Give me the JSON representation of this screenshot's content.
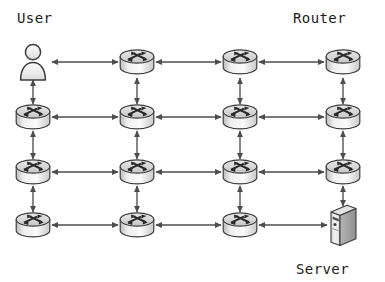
{
  "diagram": {
    "type": "network-topology",
    "background_color": "#ffffff",
    "line_color": "#4d4d4d",
    "icon_outline_color": "#3c3c3c",
    "icon_fill_light": "#f2f2f2",
    "icon_fill_mid": "#d8d8d8",
    "icon_fill_dark": "#a8a8a8",
    "label_color": "#1a1a1a",
    "labels": {
      "user": "User",
      "router": "Router",
      "server": "Server"
    },
    "grid": {
      "rows": 4,
      "columns": 4,
      "column_x": [
        33,
        137,
        240,
        343
      ],
      "row_y": [
        62,
        117,
        172,
        225
      ]
    },
    "nodes": [
      {
        "id": "n-r1c1",
        "kind": "user",
        "icon": "user-icon",
        "row": 1,
        "col": 1,
        "x": 33,
        "y": 62
      },
      {
        "id": "n-r1c2",
        "kind": "router",
        "icon": "router-icon",
        "row": 1,
        "col": 2,
        "x": 137,
        "y": 62
      },
      {
        "id": "n-r1c3",
        "kind": "router",
        "icon": "router-icon",
        "row": 1,
        "col": 3,
        "x": 240,
        "y": 62
      },
      {
        "id": "n-r1c4",
        "kind": "router",
        "icon": "router-icon",
        "row": 1,
        "col": 4,
        "x": 343,
        "y": 62
      },
      {
        "id": "n-r2c1",
        "kind": "router",
        "icon": "router-icon",
        "row": 2,
        "col": 1,
        "x": 33,
        "y": 117
      },
      {
        "id": "n-r2c2",
        "kind": "router",
        "icon": "router-icon",
        "row": 2,
        "col": 2,
        "x": 137,
        "y": 117
      },
      {
        "id": "n-r2c3",
        "kind": "router",
        "icon": "router-icon",
        "row": 2,
        "col": 3,
        "x": 240,
        "y": 117
      },
      {
        "id": "n-r2c4",
        "kind": "router",
        "icon": "router-icon",
        "row": 2,
        "col": 4,
        "x": 343,
        "y": 117
      },
      {
        "id": "n-r3c1",
        "kind": "router",
        "icon": "router-icon",
        "row": 3,
        "col": 1,
        "x": 33,
        "y": 172
      },
      {
        "id": "n-r3c2",
        "kind": "router",
        "icon": "router-icon",
        "row": 3,
        "col": 2,
        "x": 137,
        "y": 172
      },
      {
        "id": "n-r3c3",
        "kind": "router",
        "icon": "router-icon",
        "row": 3,
        "col": 3,
        "x": 240,
        "y": 172
      },
      {
        "id": "n-r3c4",
        "kind": "router",
        "icon": "router-icon",
        "row": 3,
        "col": 4,
        "x": 343,
        "y": 172
      },
      {
        "id": "n-r4c1",
        "kind": "router",
        "icon": "router-icon",
        "row": 4,
        "col": 1,
        "x": 33,
        "y": 225
      },
      {
        "id": "n-r4c2",
        "kind": "router",
        "icon": "router-icon",
        "row": 4,
        "col": 2,
        "x": 137,
        "y": 225
      },
      {
        "id": "n-r4c3",
        "kind": "router",
        "icon": "router-icon",
        "row": 4,
        "col": 3,
        "x": 240,
        "y": 225
      },
      {
        "id": "n-r4c4",
        "kind": "server",
        "icon": "server-icon",
        "row": 4,
        "col": 4,
        "x": 343,
        "y": 225
      }
    ],
    "links": [
      {
        "from": "n-r1c1",
        "to": "n-r1c2",
        "orientation": "horizontal",
        "arrows": "both"
      },
      {
        "from": "n-r1c2",
        "to": "n-r1c3",
        "orientation": "horizontal",
        "arrows": "both"
      },
      {
        "from": "n-r1c3",
        "to": "n-r1c4",
        "orientation": "horizontal",
        "arrows": "both"
      },
      {
        "from": "n-r2c1",
        "to": "n-r2c2",
        "orientation": "horizontal",
        "arrows": "both"
      },
      {
        "from": "n-r2c2",
        "to": "n-r2c3",
        "orientation": "horizontal",
        "arrows": "both"
      },
      {
        "from": "n-r2c3",
        "to": "n-r2c4",
        "orientation": "horizontal",
        "arrows": "both"
      },
      {
        "from": "n-r3c1",
        "to": "n-r3c2",
        "orientation": "horizontal",
        "arrows": "both"
      },
      {
        "from": "n-r3c2",
        "to": "n-r3c3",
        "orientation": "horizontal",
        "arrows": "both"
      },
      {
        "from": "n-r3c3",
        "to": "n-r3c4",
        "orientation": "horizontal",
        "arrows": "both"
      },
      {
        "from": "n-r4c1",
        "to": "n-r4c2",
        "orientation": "horizontal",
        "arrows": "both"
      },
      {
        "from": "n-r4c2",
        "to": "n-r4c3",
        "orientation": "horizontal",
        "arrows": "both"
      },
      {
        "from": "n-r4c3",
        "to": "n-r4c4",
        "orientation": "horizontal",
        "arrows": "both"
      },
      {
        "from": "n-r1c1",
        "to": "n-r2c1",
        "orientation": "vertical",
        "arrows": "both"
      },
      {
        "from": "n-r2c1",
        "to": "n-r3c1",
        "orientation": "vertical",
        "arrows": "both"
      },
      {
        "from": "n-r3c1",
        "to": "n-r4c1",
        "orientation": "vertical",
        "arrows": "both"
      },
      {
        "from": "n-r1c2",
        "to": "n-r2c2",
        "orientation": "vertical",
        "arrows": "both"
      },
      {
        "from": "n-r2c2",
        "to": "n-r3c2",
        "orientation": "vertical",
        "arrows": "both"
      },
      {
        "from": "n-r3c2",
        "to": "n-r4c2",
        "orientation": "vertical",
        "arrows": "both"
      },
      {
        "from": "n-r1c3",
        "to": "n-r2c3",
        "orientation": "vertical",
        "arrows": "both"
      },
      {
        "from": "n-r2c3",
        "to": "n-r3c3",
        "orientation": "vertical",
        "arrows": "both"
      },
      {
        "from": "n-r3c3",
        "to": "n-r4c3",
        "orientation": "vertical",
        "arrows": "both"
      },
      {
        "from": "n-r1c4",
        "to": "n-r2c4",
        "orientation": "vertical",
        "arrows": "both"
      },
      {
        "from": "n-r2c4",
        "to": "n-r3c4",
        "orientation": "vertical",
        "arrows": "both"
      },
      {
        "from": "n-r3c4",
        "to": "n-r4c4",
        "orientation": "vertical",
        "arrows": "both"
      }
    ]
  }
}
